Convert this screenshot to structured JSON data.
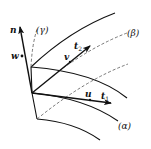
{
  "diagram": {
    "colors": {
      "line": "#111111",
      "dashed": "#555555",
      "background": "#ffffff"
    },
    "labels": {
      "n": "n",
      "w": "w",
      "gamma": "(γ)",
      "beta": "(β)",
      "alpha": "(α)",
      "v": "v",
      "t2": "t",
      "t2_sub": "2",
      "u": "u",
      "t1": "t",
      "t1_sub": "1"
    },
    "vectors": [
      {
        "name": "n",
        "from": [
          32,
          93
        ],
        "to": [
          20,
          26
        ]
      },
      {
        "name": "v / t2",
        "from": [
          32,
          93
        ],
        "to": [
          90,
          46
        ]
      },
      {
        "name": "u / t1",
        "from": [
          32,
          93
        ],
        "to": [
          111,
          103
        ]
      }
    ],
    "curves": {
      "solid": [
        {
          "name": "upper-coordinate-curve",
          "from": [
            31,
            67
          ],
          "to": [
            115,
            13
          ]
        },
        {
          "name": "middle-coordinate-curve",
          "from": [
            31,
            67
          ],
          "to": [
            127,
            98
          ]
        },
        {
          "name": "alpha-curve",
          "from": [
            32,
            93
          ],
          "to": [
            118,
            121
          ]
        },
        {
          "name": "bottom-curve",
          "from": [
            37,
            119
          ],
          "to": [
            100,
            140
          ]
        },
        {
          "name": "left-edge",
          "from": [
            31,
            67
          ],
          "to": [
            37,
            119
          ]
        }
      ],
      "dashed": [
        {
          "name": "gamma-curve",
          "from": [
            31,
            67
          ],
          "to": [
            36,
            30
          ]
        },
        {
          "name": "beta-curve",
          "from": [
            32,
            93
          ],
          "to": [
            128,
            33
          ]
        },
        {
          "name": "lower-dashed-curve",
          "from": [
            37,
            119
          ],
          "to": [
            128,
            64
          ]
        }
      ]
    }
  }
}
